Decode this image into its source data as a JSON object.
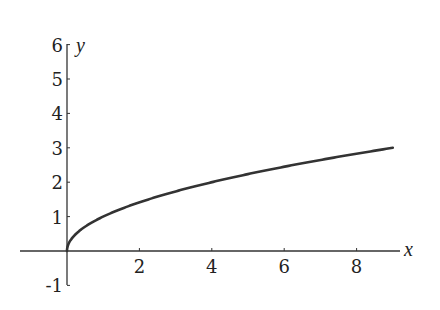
{
  "chart_data": {
    "type": "line",
    "title": "",
    "function": "y = sqrt(x)",
    "xlabel": "x",
    "ylabel": "y",
    "xlim": [
      -1.3,
      9.4
    ],
    "ylim": [
      -1,
      6
    ],
    "x_ticks": [
      2,
      4,
      6,
      8
    ],
    "y_ticks": [
      -1,
      1,
      2,
      3,
      4,
      5,
      6
    ],
    "grid": false,
    "legend": null,
    "series": [
      {
        "name": "sqrt(x)",
        "x": [
          0,
          0.1,
          0.25,
          0.5,
          1,
          2,
          3,
          4,
          5,
          6,
          7,
          8,
          9
        ],
        "y": [
          0,
          0.316,
          0.5,
          0.707,
          1,
          1.414,
          1.732,
          2,
          2.236,
          2.449,
          2.646,
          2.828,
          3
        ]
      }
    ]
  }
}
